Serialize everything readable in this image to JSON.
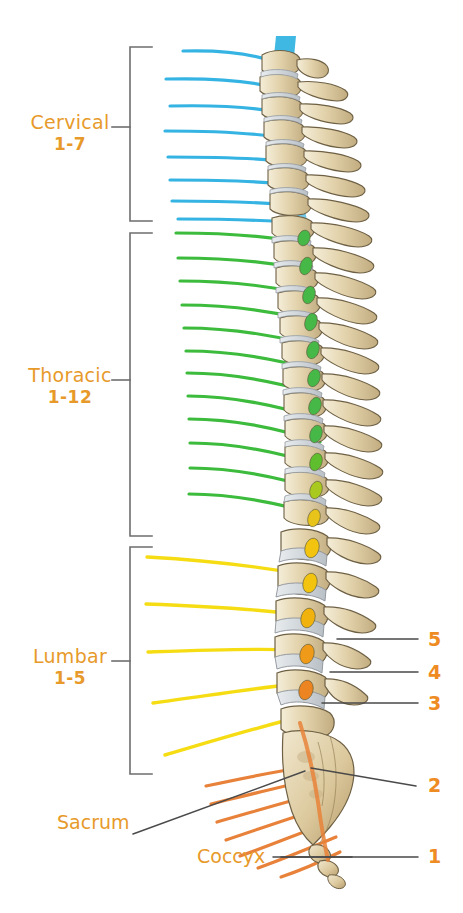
{
  "diagram": {
    "background_color": "#ffffff",
    "width": 463,
    "height": 913
  },
  "colors": {
    "label_orange": "#E79A2A",
    "number_orange": "#EE8B22",
    "cervical_nerve": "#35B4E3",
    "thoracic_nerve": "#3DBB3D",
    "lumbar_nerve": "#F5DC13",
    "sacral_nerve": "#E8823A",
    "bracket": "#6E6E6E",
    "leader_line": "#4A4A4A",
    "bone_light": "#EDE3C8",
    "bone_mid": "#D9C69B",
    "bone_shadow": "#B9A276",
    "bone_outline": "#7A6A4A",
    "disc": "#D8DCE0",
    "disc_outline": "#8C9298"
  },
  "regions": [
    {
      "id": "cervical",
      "name": "Cervical",
      "range": "1-7",
      "nerve_color": "#35B4E3",
      "nerve_count": 8,
      "bracket_top": 46,
      "bracket_bottom": 222,
      "label_x": 70,
      "label_y": 126
    },
    {
      "id": "thoracic",
      "name": "Thoracic",
      "range": "1-12",
      "nerve_color": "#3DBB3D",
      "nerve_count": 12,
      "bracket_top": 233,
      "bracket_bottom": 537,
      "label_x": 70,
      "label_y": 379
    },
    {
      "id": "lumbar",
      "name": "Lumbar",
      "range": "1-5",
      "nerve_color": "#F5DC13",
      "nerve_count": 5,
      "bracket_top": 546,
      "bracket_bottom": 775,
      "label_x": 70,
      "label_y": 660
    }
  ],
  "point_labels": [
    {
      "id": "sacrum",
      "text": "Sacrum",
      "x": 60,
      "y": 822
    },
    {
      "id": "coccyx",
      "text": "Coccyx",
      "x": 200,
      "y": 855
    }
  ],
  "vertebra_numbers": [
    {
      "id": "lumbar-5",
      "text": "5",
      "x": 430,
      "y": 630,
      "leader_from_x": 337,
      "leader_from_y": 639,
      "leader_to_x": 418,
      "leader_to_y": 639
    },
    {
      "id": "lumbar-4",
      "text": "4",
      "x": 430,
      "y": 663,
      "leader_from_x": 330,
      "leader_from_y": 672,
      "leader_to_x": 418,
      "leader_to_y": 672
    },
    {
      "id": "lumbar-3",
      "text": "3",
      "x": 430,
      "y": 694,
      "leader_from_x": 322,
      "leader_from_y": 703,
      "leader_to_x": 418,
      "leader_to_y": 703
    },
    {
      "id": "sacrum-2",
      "text": "2",
      "x": 430,
      "y": 775,
      "leader_from_x": 311,
      "leader_from_y": 768,
      "leader_to_x": 416,
      "leader_to_y": 786
    },
    {
      "id": "coccyx-1",
      "text": "1",
      "x": 430,
      "y": 846,
      "leader_from_x": 281,
      "leader_from_y": 857,
      "leader_to_x": 418,
      "leader_to_y": 857
    }
  ],
  "sacrum_leader": {
    "from_x": 133,
    "from_y": 834,
    "to_x": 305,
    "to_y": 771
  },
  "coccyx_leader": {
    "from_x": 273,
    "from_y": 857,
    "to_x": 352,
    "to_y": 857
  },
  "spinal_cord": {
    "top_bar_color": "#35B4E3",
    "description": "blue spinal cord descending through vertebral canal"
  }
}
